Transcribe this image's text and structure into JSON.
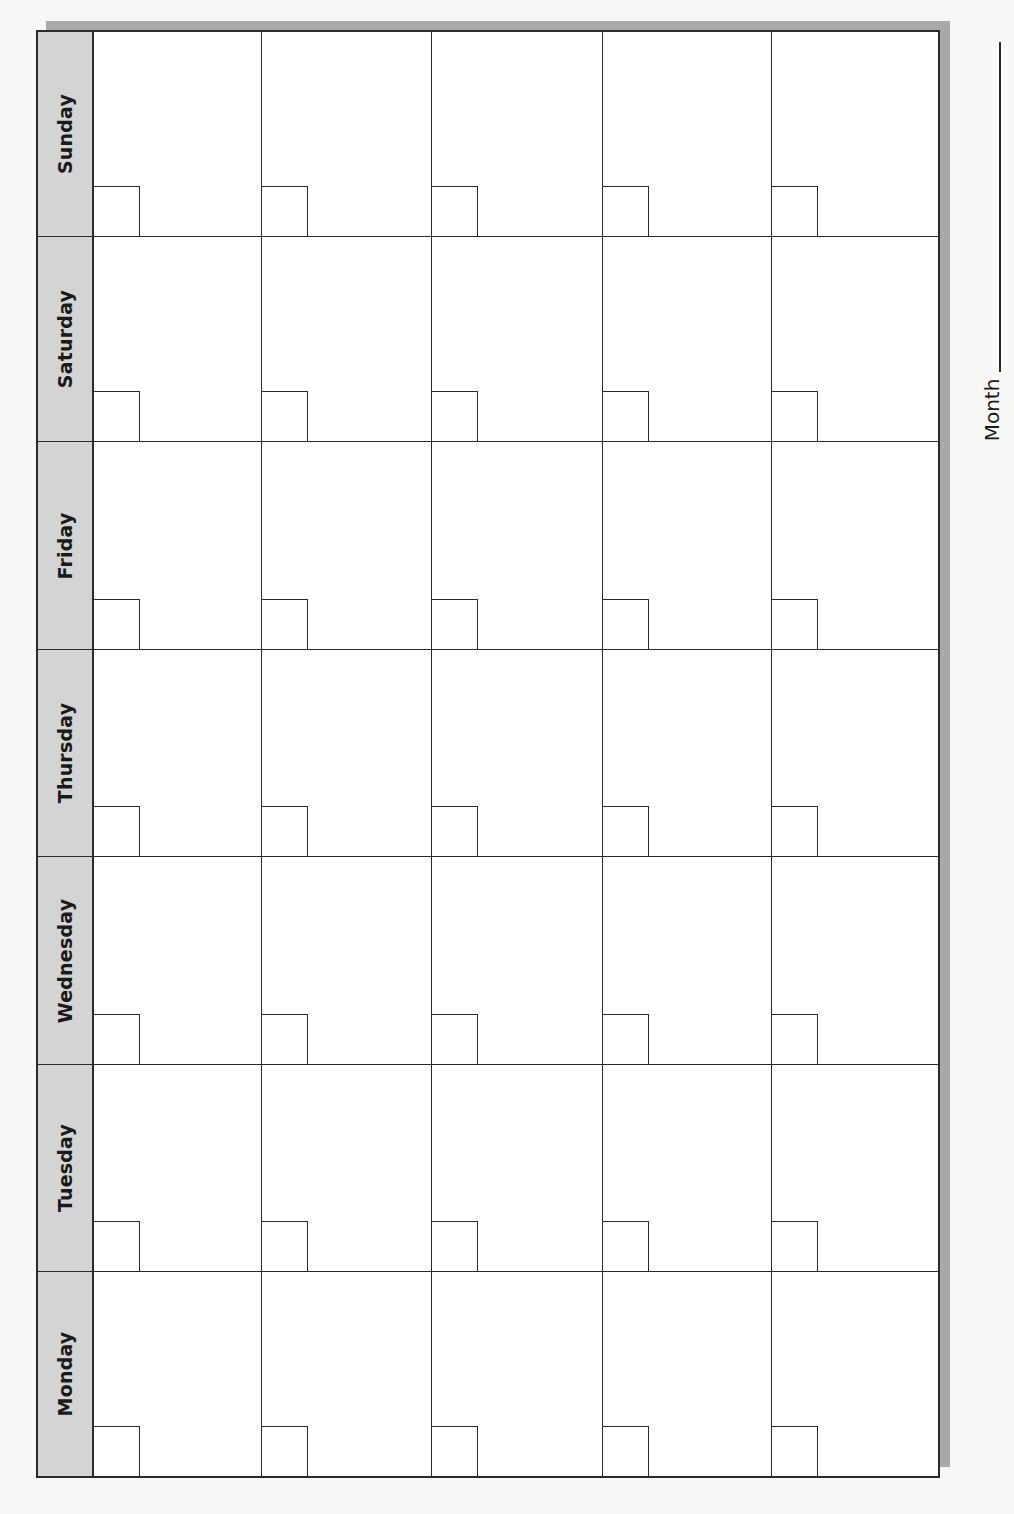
{
  "calendar": {
    "layout": "rotated-90-ccw",
    "weeks": 5,
    "days": [
      {
        "label": "Sunday"
      },
      {
        "label": "Saturday"
      },
      {
        "label": "Friday"
      },
      {
        "label": "Thursday"
      },
      {
        "label": "Wednesday"
      },
      {
        "label": "Tuesday"
      },
      {
        "label": "Monday"
      }
    ],
    "header_bg": "#d4d4d4",
    "line_color": "#2a2a2a",
    "shadow_color": "#a9a9a9"
  },
  "month_field": {
    "label": "Month",
    "value": ""
  }
}
